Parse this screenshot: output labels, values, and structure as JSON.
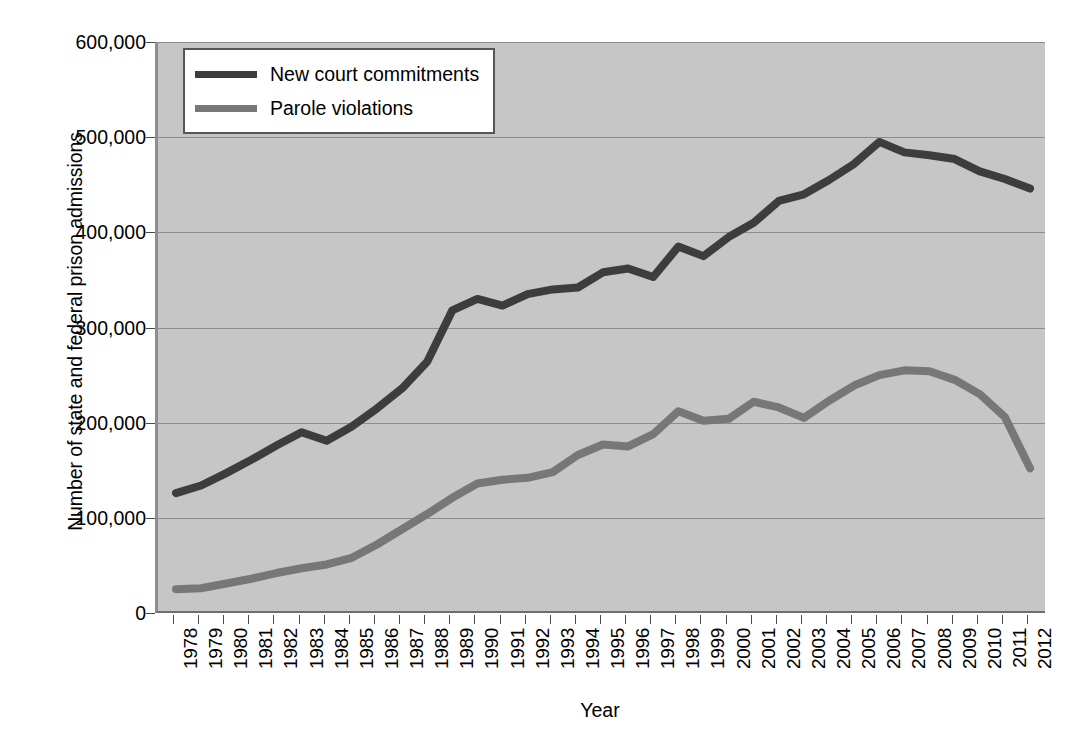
{
  "chart_data": {
    "type": "line",
    "title": "",
    "xlabel": "Year",
    "ylabel": "Number of state and federal prison admissions",
    "ylim": [
      0,
      600000
    ],
    "ytick_labels": [
      "0",
      "100,000",
      "200,000",
      "300,000",
      "400,000",
      "500,000",
      "600,000"
    ],
    "ytick_values": [
      0,
      100000,
      200000,
      300000,
      400000,
      500000,
      600000
    ],
    "grid": true,
    "legend_position": "top-left-inside",
    "categories": [
      "1978",
      "1979",
      "1980",
      "1981",
      "1982",
      "1983",
      "1984",
      "1985",
      "1986",
      "1987",
      "1988",
      "1989",
      "1990",
      "1991",
      "1992",
      "1993",
      "1994",
      "1995",
      "1996",
      "1997",
      "1998",
      "1999",
      "2000",
      "2001",
      "2002",
      "2003",
      "2004",
      "2005",
      "2006",
      "2007",
      "2008",
      "2009",
      "2010",
      "2011",
      "2012"
    ],
    "x": [
      1978,
      1979,
      1980,
      1981,
      1982,
      1983,
      1984,
      1985,
      1986,
      1987,
      1988,
      1989,
      1990,
      1991,
      1992,
      1993,
      1994,
      1995,
      1996,
      1997,
      1998,
      1999,
      2000,
      2001,
      2002,
      2003,
      2004,
      2005,
      2006,
      2007,
      2008,
      2009,
      2010,
      2011,
      2012
    ],
    "series": [
      {
        "name": "New court commitments",
        "color": "#3d3d3d",
        "values": [
          126000,
          134000,
          147000,
          161000,
          176000,
          190000,
          181000,
          196000,
          215000,
          236000,
          264000,
          318000,
          330000,
          323000,
          335000,
          340000,
          342000,
          358000,
          362000,
          353000,
          385000,
          375000,
          395000,
          410000,
          433000,
          440000,
          455000,
          472000,
          495000,
          484000,
          481000,
          477000,
          464000,
          456000,
          446000
        ]
      },
      {
        "name": "Parole violations",
        "color": "#777777",
        "values": [
          25000,
          26000,
          31000,
          36000,
          42000,
          47000,
          51000,
          58000,
          72000,
          88000,
          104000,
          121000,
          136000,
          140000,
          142000,
          148000,
          166000,
          177000,
          175000,
          188000,
          212000,
          202000,
          204000,
          222000,
          216000,
          205000,
          223000,
          239000,
          250000,
          255000,
          254000,
          245000,
          230000,
          206000,
          152000
        ]
      }
    ]
  },
  "legend": {
    "items": [
      {
        "label": "New court commitments",
        "color": "#3d3d3d"
      },
      {
        "label": "Parole violations",
        "color": "#777777"
      }
    ]
  },
  "axes": {
    "y_title": "Number of state and federal prison admissions",
    "x_title": "Year"
  },
  "colors": {
    "plot_background": "#c6c6c6",
    "page_background": "#ffffff",
    "gridline": "#8c8c8c",
    "axis": "#4a4a4a",
    "series_new_court_commitments": "#3d3d3d",
    "series_parole_violations": "#777777"
  }
}
